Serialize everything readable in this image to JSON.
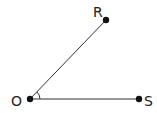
{
  "diagram": {
    "type": "angle",
    "colors": {
      "line": "#333333",
      "point": "#111111",
      "label": "#222222",
      "background": "#ffffff"
    },
    "points": [
      {
        "id": "O",
        "label": "O",
        "x": 30,
        "y": 99,
        "label_x": 11,
        "label_y": 106
      },
      {
        "id": "R",
        "label": "R",
        "x": 106,
        "y": 20,
        "label_x": 93,
        "label_y": 17
      },
      {
        "id": "S",
        "label": "S",
        "x": 139,
        "y": 99,
        "label_x": 144,
        "label_y": 106
      }
    ],
    "segments": [
      {
        "from": "O",
        "to": "R"
      },
      {
        "from": "O",
        "to": "S"
      }
    ],
    "angle_mark": {
      "vertex": "O",
      "between": [
        "R",
        "S"
      ],
      "radius": 10
    }
  }
}
